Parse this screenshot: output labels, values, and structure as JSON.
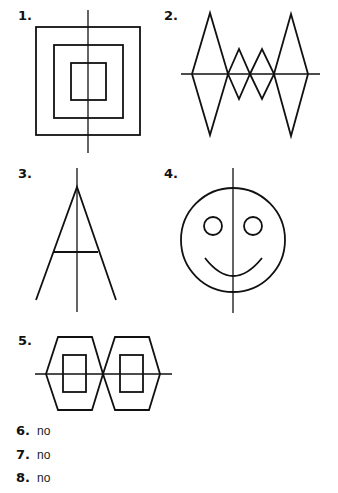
{
  "figures": [
    {
      "number": "1.",
      "shape": "concentric-squares-with-vertical-line-of-symmetry"
    },
    {
      "number": "2.",
      "shape": "zigzag-triangles-with-horizontal-line-of-symmetry"
    },
    {
      "number": "3.",
      "shape": "letter-A-easel-with-vertical-line-of-symmetry"
    },
    {
      "number": "4.",
      "shape": "smiley-face-with-vertical-line-of-symmetry"
    },
    {
      "number": "5.",
      "shape": "two-hexagons-with-horizontal-line-of-symmetry"
    }
  ],
  "answers": [
    {
      "number": "6.",
      "text": "no"
    },
    {
      "number": "7.",
      "text": "no"
    },
    {
      "number": "8.",
      "text": "no"
    }
  ],
  "colors": {
    "stroke": "#111111",
    "background": "#ffffff"
  }
}
